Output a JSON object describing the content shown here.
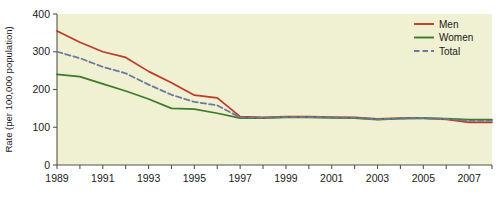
{
  "chart_data": {
    "type": "line",
    "title": "",
    "xlabel": "",
    "ylabel": "Rate (per 100,000 population)",
    "xlim": [
      1989,
      2008
    ],
    "ylim": [
      0,
      400
    ],
    "yticks": [
      0,
      100,
      200,
      300,
      400
    ],
    "ytick_labels": [
      "0",
      "100",
      "200",
      "300",
      "400"
    ],
    "x": [
      1989,
      1990,
      1991,
      1992,
      1993,
      1994,
      1995,
      1996,
      1997,
      1998,
      1999,
      2000,
      2001,
      2002,
      2003,
      2004,
      2005,
      2006,
      2007,
      2008
    ],
    "xtick_labels": [
      "1989",
      "1991",
      "1993",
      "1995",
      "1997",
      "1999",
      "2001",
      "2003",
      "2005",
      "2007"
    ],
    "xticks_labeled": [
      1989,
      1991,
      1993,
      1995,
      1997,
      1999,
      2001,
      2003,
      2005,
      2007
    ],
    "grid": false,
    "legend_position": "top-right",
    "series": [
      {
        "name": "Men",
        "color": "#c0392b",
        "style": "solid",
        "values": [
          355,
          325,
          300,
          285,
          248,
          218,
          185,
          178,
          128,
          126,
          128,
          128,
          127,
          126,
          122,
          124,
          124,
          121,
          113,
          113
        ]
      },
      {
        "name": "Women",
        "color": "#3d7a2a",
        "style": "solid",
        "values": [
          240,
          234,
          215,
          196,
          175,
          150,
          148,
          137,
          124,
          124,
          126,
          126,
          125,
          124,
          120,
          123,
          124,
          123,
          120,
          120
        ]
      },
      {
        "name": "Total",
        "color": "#6b7a9c",
        "style": "dashed",
        "values": [
          300,
          283,
          260,
          243,
          213,
          186,
          167,
          158,
          126,
          125,
          127,
          127,
          126,
          125,
          121,
          123,
          124,
          122,
          117,
          117
        ]
      }
    ]
  },
  "legend": {
    "items": [
      {
        "label": "Men"
      },
      {
        "label": "Women"
      },
      {
        "label": "Total"
      }
    ]
  }
}
